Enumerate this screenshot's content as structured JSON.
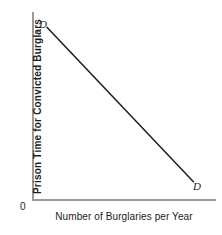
{
  "chart_data": {
    "type": "line",
    "title": "",
    "subtitle": "",
    "xlabel": "Number of Burglaries per Year",
    "ylabel": "Prison Time for Convicted Burglars",
    "origin_label": "0",
    "grid": false,
    "legend": null,
    "xlim": [
      0,
      100
    ],
    "ylim": [
      0,
      100
    ],
    "xticks": [],
    "yticks": [],
    "xticklabels": [],
    "yticklabels": [],
    "series": [
      {
        "name": "D",
        "description": "Downward-sloping demand curve for burglaries",
        "x": [
          8,
          88
        ],
        "y": [
          92,
          9
        ],
        "color": "#1c1c1c",
        "linewidth": 1.5,
        "annotations": [
          {
            "text": "D",
            "x": 5,
            "y": 96,
            "position": "upper-left"
          },
          {
            "text": "D",
            "x": 93,
            "y": 6,
            "position": "lower-right"
          }
        ]
      }
    ]
  },
  "axis": {
    "y_title": "Prison Time for Convicted Burglars",
    "x_title": "Number of Burglaries per Year",
    "origin": "0",
    "color": "#9a9a9a"
  },
  "curve": {
    "top_label": "D",
    "bottom_label": "D",
    "color": "#1c1c1c"
  }
}
